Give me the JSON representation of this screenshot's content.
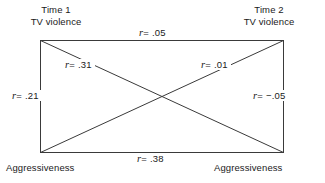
{
  "diagram": {
    "type": "cross-lagged-panel-correlation",
    "nodes": {
      "top_left": "Time 1\nTV violence",
      "top_right": "Time 2\nTV violence",
      "bottom_left": "Aggressiveness",
      "bottom_right": "Aggressiveness"
    },
    "paths": [
      {
        "id": "top",
        "symbol": "r",
        "equals": "=",
        "value": ".05",
        "from": "top_left",
        "to": "top_right"
      },
      {
        "id": "bottom",
        "symbol": "r",
        "equals": "=",
        "value": ".38",
        "from": "bottom_left",
        "to": "bottom_right"
      },
      {
        "id": "left",
        "symbol": "r",
        "equals": "=",
        "value": ".21",
        "from": "top_left",
        "to": "bottom_left"
      },
      {
        "id": "right",
        "symbol": "r",
        "equals": "=",
        "value": "−.05",
        "from": "top_right",
        "to": "bottom_right"
      },
      {
        "id": "diag-desc",
        "symbol": "r",
        "equals": "=",
        "value": ".31",
        "from": "top_left",
        "to": "bottom_right"
      },
      {
        "id": "diag-asc",
        "symbol": "r",
        "equals": "=",
        "value": ".01",
        "from": "bottom_left",
        "to": "top_right"
      }
    ],
    "colors": {
      "background": "#ffffff",
      "line": "#3a3a3a",
      "text": "#1a1a1a"
    }
  }
}
